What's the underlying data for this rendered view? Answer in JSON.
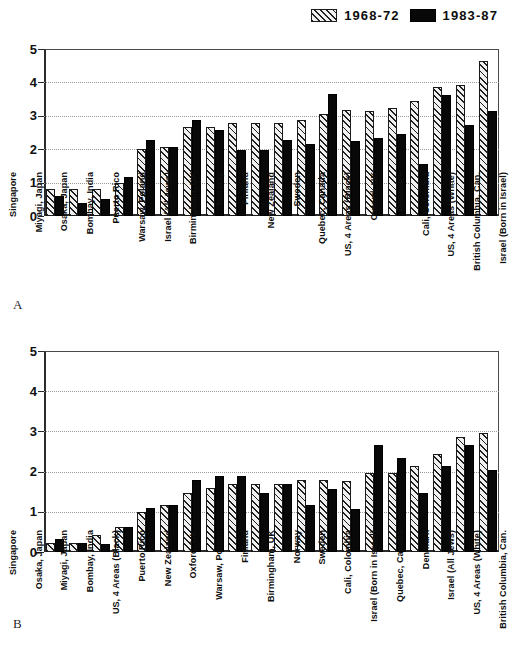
{
  "legend": {
    "items": [
      {
        "label": "1968-72",
        "style": "hatch",
        "swatch_name": "legend-swatch-hatched"
      },
      {
        "label": "1983-87",
        "style": "solid",
        "swatch_name": "legend-swatch-solid"
      }
    ]
  },
  "panels": [
    {
      "letter": "A"
    },
    {
      "letter": "B"
    }
  ],
  "axis": {
    "ticks": [
      "0",
      "1",
      "2",
      "3",
      "4",
      "5"
    ],
    "min": 0,
    "max": 5
  },
  "chart_data": [
    {
      "type": "bar",
      "panel": "A",
      "title": "",
      "xlabel": "",
      "ylabel": "",
      "ylim": [
        0,
        5
      ],
      "yticks": [
        0,
        1,
        2,
        3,
        4,
        5
      ],
      "grid": true,
      "legend_position": "top-right",
      "categories": [
        "Singapore",
        "Miyagi, Japan",
        "Osaka, Japan",
        "Bombay, India",
        "Puerto Rico",
        "Warsaw, Poland",
        "Israel (All Jews)",
        "Birmingham, UK",
        "Norway",
        "Finland",
        "New Zealand",
        "Sweden",
        "Quebec, Canada",
        "US, 4 Areas (Black)",
        "Oxford, UK",
        "Denmark",
        "Cali, Colombia",
        "US, 4 Areas (White)",
        "British Columbia, Can.",
        "Israel (Born in Israel)"
      ],
      "series": [
        {
          "name": "1968-72",
          "values": [
            0.8,
            0.8,
            0.8,
            1.0,
            2.0,
            2.08,
            2.68,
            2.68,
            2.77,
            2.77,
            2.77,
            2.87,
            3.06,
            3.16,
            3.15,
            3.24,
            3.44,
            3.85,
            3.93,
            4.63
          ]
        },
        {
          "name": "1983-87",
          "values": [
            0.6,
            0.4,
            0.5,
            1.17,
            2.28,
            2.08,
            2.88,
            2.58,
            1.98,
            1.98,
            2.27,
            2.17,
            3.65,
            2.26,
            2.35,
            2.45,
            1.55,
            3.62,
            2.73,
            3.13
          ]
        }
      ]
    },
    {
      "type": "bar",
      "panel": "B",
      "title": "",
      "xlabel": "",
      "ylabel": "",
      "ylim": [
        0,
        5
      ],
      "yticks": [
        0,
        1,
        2,
        3,
        4,
        5
      ],
      "grid": true,
      "legend_position": "top-right",
      "categories": [
        "Singapore",
        "Osaka, Japan",
        "Miyagi, Japan",
        "Bombay, India",
        "US, 4 Areas (Black)",
        "Puerto Rico",
        "New Zealand",
        "Oxford, UK",
        "Warsaw, Poland",
        "Finland",
        "Birmingham, UK",
        "Norway",
        "Sweden",
        "Cali, Colombia",
        "Israel (Born in Israel)",
        "Quebec, Canada",
        "Denmark",
        "Israel (All Jews)",
        "US, 4 Areas (White)",
        "British Columbia, Can."
      ],
      "series": [
        {
          "name": "1968-72",
          "values": [
            0.22,
            0.22,
            0.42,
            0.62,
            1.0,
            1.18,
            1.48,
            1.6,
            1.68,
            1.7,
            1.68,
            1.78,
            1.78,
            1.77,
            1.97,
            1.97,
            2.15,
            2.45,
            2.87,
            2.97
          ]
        },
        {
          "name": "1983-87",
          "values": [
            0.32,
            0.22,
            0.2,
            0.62,
            1.09,
            1.18,
            1.79,
            1.88,
            1.88,
            1.48,
            1.68,
            1.18,
            1.57,
            1.08,
            2.65,
            2.35,
            1.46,
            2.15,
            2.65,
            2.05
          ]
        }
      ]
    }
  ]
}
